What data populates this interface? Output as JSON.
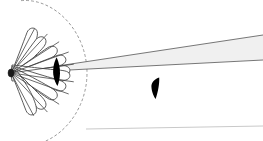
{
  "figure": {
    "title": "Antenna radiation lobe pattern with main beam",
    "width": 263,
    "height": 141,
    "background_color": "#ffffff",
    "caption": ""
  },
  "colors": {
    "background": "#ffffff",
    "lobe_outline": "#4a4a4a",
    "lobe_fill": "#ffffff",
    "ray_line": "#3a3a3a",
    "beam_fill": "#f0f0f0",
    "beam_outline": "#555555",
    "blade_fill": "#000000",
    "dashed_arc": "#8c8c8c",
    "baseline": "#c9c9c9",
    "source_dot": "#1a1a1a"
  },
  "source": {
    "label": "source-point",
    "x": 11,
    "y": 73,
    "radius_x": 3.0,
    "radius_y": 4.0
  },
  "chart_data": {
    "type": "scatter",
    "title": "Antenna radiation lobe pattern with main beam",
    "xlabel": "",
    "ylabel": "",
    "lobes": [
      {
        "name": "lobe-upper-5",
        "angle_deg": 62,
        "length": 47,
        "half_width": 6.5
      },
      {
        "name": "lobe-upper-4",
        "angle_deg": 47,
        "length": 50,
        "half_width": 6.5
      },
      {
        "name": "lobe-upper-3",
        "angle_deg": 33,
        "length": 54,
        "half_width": 6.5
      },
      {
        "name": "lobe-upper-2",
        "angle_deg": 20,
        "length": 58,
        "half_width": 6.5
      },
      {
        "name": "lobe-upper-1",
        "angle_deg": 8,
        "length": 60,
        "half_width": 6.5
      },
      {
        "name": "lobe-lower-1",
        "angle_deg": -8,
        "length": 60,
        "half_width": 6.5
      },
      {
        "name": "lobe-lower-2",
        "angle_deg": -20,
        "length": 58,
        "half_width": 6.5
      },
      {
        "name": "lobe-lower-3",
        "angle_deg": -33,
        "length": 54,
        "half_width": 6.5
      },
      {
        "name": "lobe-lower-4",
        "angle_deg": -47,
        "length": 50,
        "half_width": 6.5
      },
      {
        "name": "lobe-lower-5",
        "angle_deg": -62,
        "length": 45,
        "half_width": 6.5
      }
    ],
    "rays": [
      {
        "name": "ray-1",
        "angle_deg": 62,
        "length": 50
      },
      {
        "name": "ray-2",
        "angle_deg": 47,
        "length": 53
      },
      {
        "name": "ray-3",
        "angle_deg": 33,
        "length": 57
      },
      {
        "name": "ray-4",
        "angle_deg": 20,
        "length": 61
      },
      {
        "name": "ray-5",
        "angle_deg": 8,
        "length": 63
      },
      {
        "name": "ray-6",
        "angle_deg": -8,
        "length": 63
      },
      {
        "name": "ray-7",
        "angle_deg": -20,
        "length": 61
      },
      {
        "name": "ray-8",
        "angle_deg": -33,
        "length": 57
      },
      {
        "name": "ray-9",
        "angle_deg": -47,
        "length": 53
      },
      {
        "name": "ray-10",
        "angle_deg": -62,
        "length": 48
      }
    ],
    "dashed_arc": {
      "name": "envelope-arc",
      "center_x": 11,
      "center_y": 73,
      "radius_x": 76,
      "radius_y": 74,
      "start_angle_deg": -82,
      "end_angle_deg": 82,
      "dash_pattern": "2 3"
    },
    "beam": {
      "name": "main-beam-wedge",
      "apex_x": 11,
      "apex_y": 73,
      "top_far_x": 263,
      "top_far_y": 35,
      "bottom_far_x": 263,
      "bottom_far_y": 60,
      "fill": "#f0f0f0"
    },
    "blades": [
      {
        "name": "blade-near",
        "x": 53,
        "y": 57,
        "width": 8,
        "height": 29,
        "fill": "#000000"
      },
      {
        "name": "blade-far",
        "x": 151,
        "y": 77,
        "width": 9,
        "height": 24,
        "fill": "#000000"
      }
    ],
    "baseline": {
      "name": "ground-baseline",
      "x1": 86,
      "y1": 129,
      "x2": 263,
      "y2": 126
    }
  }
}
